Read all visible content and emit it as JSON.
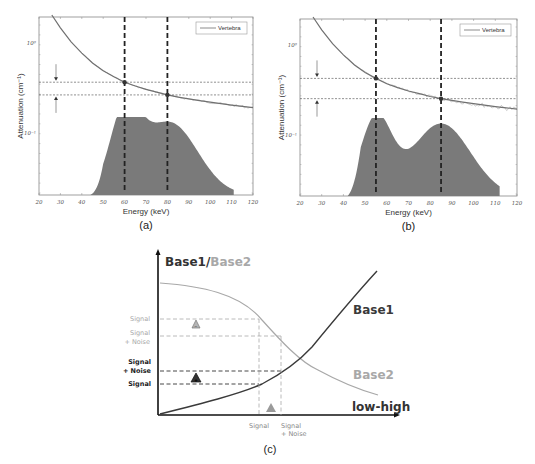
{
  "colors": {
    "curve": "#707070",
    "noise": "#9a9a9a",
    "spectrum": "#7a7a7a",
    "frame": "#888888",
    "dashed_dark": "#222222",
    "base1": "#3a3a3a",
    "base2": "#a8a8a8",
    "axis_c": "#111111"
  },
  "chart_data": [
    {
      "id": "a",
      "type": "line",
      "caption": "(a)",
      "xlabel": "Energy (keV)",
      "ylabel": "Attenuation (cm⁻¹)",
      "yscale": "log",
      "xlim": [
        20,
        120
      ],
      "xticks": [
        "20",
        "30",
        "40",
        "50",
        "60",
        "70",
        "80",
        "90",
        "100",
        "110",
        "120"
      ],
      "yticks": [
        "10⁰",
        "10⁻¹"
      ],
      "legend": [
        "Vertebra"
      ],
      "legend_position": "upper right",
      "series": [
        {
          "name": "Vertebra",
          "x": [
            26,
            30,
            35,
            40,
            45,
            50,
            55,
            60,
            65,
            70,
            75,
            80,
            85,
            90,
            95,
            100,
            105,
            110,
            115,
            120
          ],
          "y_rel": [
            1.0,
            0.86,
            0.73,
            0.64,
            0.57,
            0.52,
            0.485,
            0.455,
            0.435,
            0.418,
            0.405,
            0.392,
            0.382,
            0.374,
            0.367,
            0.36,
            0.354,
            0.348,
            0.343,
            0.338
          ]
        }
      ],
      "spectrum": {
        "description": "dual-peak tube spectrum (shaded)",
        "peaks_keV": [
          60,
          81
        ],
        "range_keV": [
          44,
          111
        ]
      },
      "markers": {
        "energies_keV": [
          60,
          80
        ],
        "attenuation_levels": [
          "high",
          "low"
        ]
      },
      "annotation": "arrows indicate gap between attenuation at the two energies"
    },
    {
      "id": "b",
      "type": "line",
      "caption": "(b)",
      "xlabel": "Energy (keV)",
      "ylabel": "Attenuation (cm⁻¹)",
      "yscale": "log",
      "xlim": [
        20,
        120
      ],
      "xticks": [
        "20",
        "30",
        "40",
        "50",
        "60",
        "70",
        "80",
        "90",
        "100",
        "110",
        "120"
      ],
      "yticks": [
        "10⁰",
        "10⁻¹"
      ],
      "legend": [
        "Vertebra"
      ],
      "legend_position": "upper right",
      "series": [
        {
          "name": "Vertebra",
          "x": [
            26,
            30,
            35,
            40,
            45,
            50,
            55,
            60,
            65,
            70,
            75,
            80,
            85,
            90,
            95,
            100,
            105,
            110,
            115,
            120
          ],
          "y_rel": [
            1.0,
            0.86,
            0.73,
            0.64,
            0.57,
            0.52,
            0.485,
            0.455,
            0.435,
            0.418,
            0.405,
            0.392,
            0.382,
            0.374,
            0.367,
            0.36,
            0.354,
            0.348,
            0.343,
            0.338
          ]
        }
      ],
      "spectrum": {
        "description": "dual-peak spectrum with wider separation (shaded)",
        "peaks_keV": [
          55,
          85
        ],
        "range_keV": [
          42,
          112
        ]
      },
      "markers": {
        "energies_keV": [
          55,
          85
        ],
        "attenuation_levels": [
          "high",
          "low"
        ]
      },
      "annotation": "arrows indicate larger gap between attenuation at the two energies"
    },
    {
      "id": "c",
      "type": "line",
      "caption": "(c)",
      "title": "Base1/Base2",
      "title_parts": [
        "Base1",
        "/",
        "Base2"
      ],
      "xlabel": "low-high",
      "series": [
        {
          "name": "Base1",
          "trend": "increasing",
          "color": "dark"
        },
        {
          "name": "Base2",
          "trend": "decreasing",
          "color": "light"
        }
      ],
      "y_labels_base2": [
        "Signal",
        "Signal",
        "+ Noise"
      ],
      "y_labels_base1": [
        "Signal",
        "+ Noise",
        "Signal"
      ],
      "x_labels": [
        "Signal",
        "Signal",
        "+ Noise"
      ],
      "annotations": [
        "triangle with minus (Base2 decreases)",
        "triangle with plus (Base1 increases)",
        "triangle (x shift)"
      ]
    }
  ],
  "labels": {
    "a_caption": "(a)",
    "b_caption": "(b)",
    "c_caption": "(c)",
    "xlabel": "Energy (keV)",
    "ylabel": "Attenuation (cm⁻¹)",
    "legend": "Vertebra",
    "ytick_top": "10⁰",
    "ytick_bot": "10⁻¹",
    "c_title_base1": "Base1",
    "c_title_slash": "/",
    "c_title_base2": "Base2",
    "c_base1": "Base1",
    "c_base2": "Base2",
    "c_xlabel": "low-high",
    "c_signal": "Signal",
    "c_plus_noise": "+ Noise",
    "c_minus": "−",
    "c_plus": "+"
  }
}
